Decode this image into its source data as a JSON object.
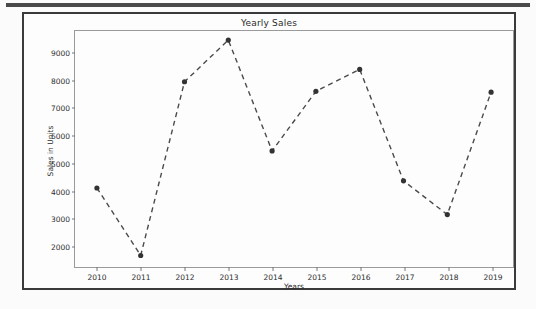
{
  "figure": {
    "title": "Yearly Sales",
    "line_color": "#4a4a4a",
    "marker_color": "#333333",
    "frame_color": "#3a3a3a",
    "axes_color": "#9a9a9a",
    "background": "#fdfdfd"
  },
  "chart_data": {
    "type": "line",
    "title": "Yearly Sales",
    "xlabel": "Years",
    "ylabel": "Sales in Units",
    "x": [
      2010,
      2011,
      2012,
      2013,
      2014,
      2015,
      2016,
      2017,
      2018,
      2019
    ],
    "categories": [
      "2010",
      "2011",
      "2012",
      "2013",
      "2014",
      "2015",
      "2016",
      "2017",
      "2018",
      "2019"
    ],
    "values": [
      4080,
      1620,
      7950,
      9470,
      5430,
      7600,
      8400,
      4340,
      3110,
      7570
    ],
    "series": [
      {
        "name": "Sales in Units",
        "values": [
          4080,
          1620,
          7950,
          9470,
          5430,
          7600,
          8400,
          4340,
          3110,
          7570
        ],
        "linestyle": "dashed",
        "marker": "circle",
        "color": "#4a4a4a"
      }
    ],
    "xtick_labels": [
      "2010",
      "2011",
      "2012",
      "2013",
      "2014",
      "2015",
      "2016",
      "2017",
      "2018",
      "2019"
    ],
    "ytick_labels": [
      "2000",
      "3000",
      "4000",
      "5000",
      "6000",
      "7000",
      "8000",
      "9000"
    ],
    "yticks": [
      2000,
      3000,
      4000,
      5000,
      6000,
      7000,
      8000,
      9000
    ],
    "ylim": [
      1200,
      9800
    ],
    "xlim": [
      2009.5,
      2019.5
    ],
    "grid": false,
    "legend": null,
    "legend_position": "none"
  }
}
